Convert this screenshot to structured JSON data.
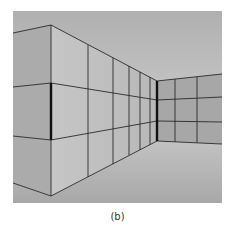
{
  "figure": {
    "caption": "(b)",
    "colors": {
      "sky_top": "#b3b3b3",
      "sky_bottom": "#dcdcdc",
      "floor_top": "#bdbdbd",
      "floor_bottom": "#a9a9a9",
      "left_face": "#ababab",
      "receding_wall": "#c3c3c3",
      "back_wall": "#a8a8a8",
      "line": "#2a2a2a"
    }
  }
}
